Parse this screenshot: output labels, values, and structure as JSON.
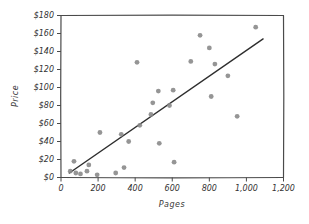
{
  "chart_data": {
    "type": "scatter",
    "title": "",
    "xlabel": "Pages",
    "ylabel": "Price",
    "xlim": [
      0,
      1200
    ],
    "ylim": [
      0,
      180
    ],
    "grid": false,
    "legend": "none",
    "frame": "full-box",
    "style_note": "hand-drawn xkcd-like sketch style, gray dots, dark straight trend line",
    "x_tick_values": [
      0,
      200,
      400,
      600,
      800,
      1000,
      1200
    ],
    "x_tick_labels": [
      "0",
      "200",
      "400",
      "600",
      "800",
      "1,000",
      "1,200"
    ],
    "y_tick_values": [
      0,
      20,
      40,
      60,
      80,
      100,
      120,
      140,
      160,
      180
    ],
    "y_tick_labels": [
      "$0",
      "$20",
      "$40",
      "$60",
      "$80",
      "$100",
      "$120",
      "$140",
      "$160",
      "$180"
    ],
    "points": [
      {
        "pages": 50,
        "price": 7
      },
      {
        "pages": 70,
        "price": 18
      },
      {
        "pages": 80,
        "price": 5
      },
      {
        "pages": 105,
        "price": 4
      },
      {
        "pages": 140,
        "price": 7
      },
      {
        "pages": 150,
        "price": 14
      },
      {
        "pages": 195,
        "price": 3
      },
      {
        "pages": 210,
        "price": 50
      },
      {
        "pages": 295,
        "price": 5
      },
      {
        "pages": 325,
        "price": 48
      },
      {
        "pages": 340,
        "price": 11
      },
      {
        "pages": 365,
        "price": 40
      },
      {
        "pages": 410,
        "price": 128
      },
      {
        "pages": 425,
        "price": 58
      },
      {
        "pages": 485,
        "price": 70
      },
      {
        "pages": 495,
        "price": 83
      },
      {
        "pages": 525,
        "price": 96
      },
      {
        "pages": 530,
        "price": 38
      },
      {
        "pages": 585,
        "price": 80
      },
      {
        "pages": 605,
        "price": 97
      },
      {
        "pages": 610,
        "price": 17
      },
      {
        "pages": 700,
        "price": 129
      },
      {
        "pages": 750,
        "price": 158
      },
      {
        "pages": 800,
        "price": 144
      },
      {
        "pages": 810,
        "price": 90
      },
      {
        "pages": 830,
        "price": 126
      },
      {
        "pages": 900,
        "price": 113
      },
      {
        "pages": 950,
        "price": 68
      },
      {
        "pages": 1050,
        "price": 167
      }
    ],
    "trend_line": {
      "from": {
        "pages": 45,
        "price": 5
      },
      "to": {
        "pages": 1090,
        "price": 154
      }
    },
    "colors": {
      "dot": "#8a8a8a",
      "trend": "#2e2e2e",
      "axis": "#4a4a4a",
      "text": "#333333",
      "background": "#ffffff"
    }
  }
}
